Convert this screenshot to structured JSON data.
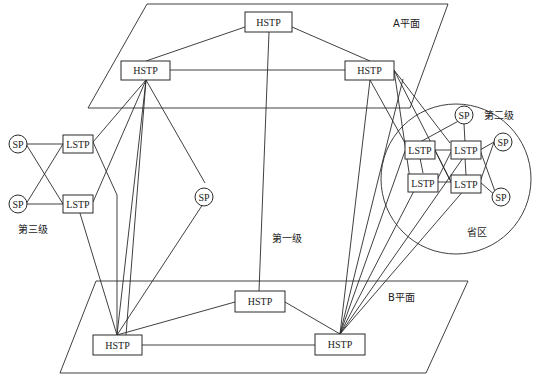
{
  "labels": {
    "plane_a": "A平面",
    "plane_b": "B平面",
    "level_1": "第一级",
    "level_2": "第二级",
    "level_3": "第三级",
    "province": "省区"
  },
  "nodes": {
    "hstp_a_top": "HSTP",
    "hstp_a_left": "HSTP",
    "hstp_a_right": "HSTP",
    "hstp_b_mid": "HSTP",
    "hstp_b_left": "HSTP",
    "hstp_b_right": "HSTP",
    "lstp_l1": "LSTP",
    "lstp_l2": "LSTP",
    "lstp_r1": "LSTP",
    "lstp_r2": "LSTP",
    "lstp_r3": "LSTP",
    "lstp_r4": "LSTP",
    "sp_l1": "SP",
    "sp_l2": "SP",
    "sp_mid": "SP",
    "sp_r1": "SP",
    "sp_r2": "SP",
    "sp_r3": "SP"
  }
}
